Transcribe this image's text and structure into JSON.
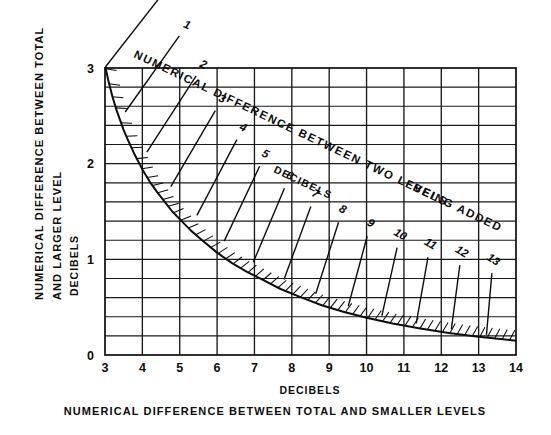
{
  "chart_data": {
    "type": "line",
    "title": "NUMERICAL DIFFERENCE BETWEEN TWO LEVELS BEING ADDED",
    "title_units": "DECIBELS",
    "subtitle": "",
    "xlabel": "NUMERICAL DIFFERENCE BETWEEN TOTAL AND SMALLER LEVELS",
    "xlabel_units": "DECIBELS",
    "ylabel": "NUMERICAL DIFFERENCE BETWEEN TOTAL AND LARGER LEVEL",
    "ylabel_units": "DECIBELS",
    "xlim": [
      3,
      14
    ],
    "ylim": [
      0,
      3
    ],
    "xticks": [
      "3",
      "4",
      "5",
      "6",
      "7",
      "8",
      "9",
      "10",
      "11",
      "12",
      "13",
      "14"
    ],
    "xtick_values": [
      3,
      4,
      5,
      6,
      7,
      8,
      9,
      10,
      11,
      12,
      13,
      14
    ],
    "yticks": [
      "0",
      "1",
      "2",
      "3"
    ],
    "ytick_values": [
      0,
      1,
      2,
      3
    ],
    "grid": true,
    "grid_x_step": 1,
    "grid_y_step": 0.2,
    "legend": "none",
    "series": [
      {
        "name": "decibel-addition-curve",
        "note": "y = x - d ; x = 10*log10(1+10^(d/10)) + d",
        "x": [
          3.01,
          3.1,
          3.2,
          3.3,
          3.4,
          3.5,
          3.6,
          3.8,
          4.0,
          4.2,
          4.4,
          4.6,
          4.8,
          5.0,
          5.3,
          5.6,
          6.0,
          6.4,
          6.8,
          7.2,
          7.7,
          8.2,
          8.8,
          9.4,
          10.0,
          10.7,
          11.4,
          12.2,
          13.0,
          14.0
        ],
        "y": [
          3.01,
          2.85,
          2.7,
          2.57,
          2.46,
          2.35,
          2.26,
          2.09,
          1.94,
          1.81,
          1.7,
          1.6,
          1.5,
          1.42,
          1.3,
          1.2,
          1.07,
          0.96,
          0.87,
          0.79,
          0.69,
          0.61,
          0.52,
          0.45,
          0.39,
          0.33,
          0.28,
          0.23,
          0.19,
          0.15
        ]
      }
    ],
    "radial_lines": [
      {
        "label": "0",
        "x_at_curve": 3.01,
        "y_at_curve": 3.01
      },
      {
        "label": "1",
        "x_at_curve": 3.54,
        "y_at_curve": 2.54
      },
      {
        "label": "2",
        "x_at_curve": 4.12,
        "y_at_curve": 2.12
      },
      {
        "label": "3",
        "x_at_curve": 4.76,
        "y_at_curve": 1.76
      },
      {
        "label": "4",
        "x_at_curve": 5.46,
        "y_at_curve": 1.46
      },
      {
        "label": "5",
        "x_at_curve": 6.19,
        "y_at_curve": 1.19
      },
      {
        "label": "6",
        "x_at_curve": 6.97,
        "y_at_curve": 0.97
      },
      {
        "label": "7",
        "x_at_curve": 7.79,
        "y_at_curve": 0.79
      },
      {
        "label": "8",
        "x_at_curve": 8.64,
        "y_at_curve": 0.64
      },
      {
        "label": "9",
        "x_at_curve": 9.51,
        "y_at_curve": 0.51
      },
      {
        "label": "10",
        "x_at_curve": 10.41,
        "y_at_curve": 0.41
      },
      {
        "label": "11",
        "x_at_curve": 11.33,
        "y_at_curve": 0.33
      },
      {
        "label": "12",
        "x_at_curve": 12.27,
        "y_at_curve": 0.27
      },
      {
        "label": "13",
        "x_at_curve": 13.21,
        "y_at_curve": 0.21
      }
    ]
  },
  "axes": {
    "x_tick_labels": [
      "3",
      "4",
      "5",
      "6",
      "7",
      "8",
      "9",
      "10",
      "11",
      "12",
      "13",
      "14"
    ],
    "y_tick_labels": [
      "3",
      "2",
      "1",
      "0"
    ]
  },
  "labels": {
    "title_line1": "NUMERICAL DIFFERENCE BETWEEN TWO LEVELS",
    "title_line1b": "BEING ADDED",
    "title_line2": "DECIBELS",
    "y_axis_line1": "NUMERICAL DIFFERENCE BETWEEN TOTAL",
    "y_axis_line2": "AND LARGER LEVEL",
    "y_axis_line3": "DECIBELS",
    "x_axis_line1": "DECIBELS",
    "x_axis_line2": "NUMERICAL DIFFERENCE BETWEEN TOTAL AND SMALLER LEVELS"
  },
  "colors": {
    "ink": "#0d0d0d",
    "grid": "#1a1a1a",
    "background": "#ffffff"
  }
}
